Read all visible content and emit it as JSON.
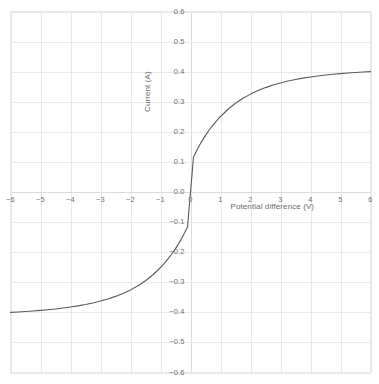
{
  "chart_data": {
    "type": "line",
    "title": "",
    "xlabel": "Potential difference (V)",
    "ylabel": "Current (A)",
    "xlim": [
      -6,
      6
    ],
    "ylim": [
      -0.6,
      0.6
    ],
    "grid": true,
    "legend": "none",
    "x_ticks": [
      "-6",
      "-5",
      "-4",
      "-3",
      "-2",
      "-1",
      "0",
      "1",
      "2",
      "3",
      "4",
      "5",
      "6"
    ],
    "x_tick_values": [
      -6,
      -5,
      -4,
      -3,
      -2,
      -1,
      0,
      1,
      2,
      3,
      4,
      5,
      6
    ],
    "y_ticks": [
      "0.6",
      "0.5",
      "0.4",
      "0.3",
      "0.2",
      "0.1",
      "0.0",
      "-0.1",
      "-0.2",
      "-0.3",
      "-0.4",
      "-0.5",
      "-0.6"
    ],
    "y_tick_values": [
      0.6,
      0.5,
      0.4,
      0.3,
      0.2,
      0.1,
      0.0,
      -0.1,
      -0.2,
      -0.3,
      -0.4,
      -0.5,
      -0.6
    ],
    "series": [
      {
        "name": "Current vs potential difference",
        "color": "#5a5a5a",
        "x": [
          -6.0,
          -5.75,
          -5.5,
          -5.25,
          -5.0,
          -4.75,
          -4.5,
          -4.25,
          -4.0,
          -3.75,
          -3.5,
          -3.25,
          -3.0,
          -2.75,
          -2.5,
          -2.25,
          -2.0,
          -1.75,
          -1.5,
          -1.25,
          -1.0,
          -0.875,
          -0.75,
          -0.625,
          -0.5,
          -0.4,
          -0.3,
          -0.2,
          -0.1,
          0.0,
          0.1,
          0.2,
          0.3,
          0.4,
          0.5,
          0.625,
          0.75,
          0.875,
          1.0,
          1.25,
          1.5,
          1.75,
          2.0,
          2.25,
          2.5,
          2.75,
          3.0,
          3.25,
          3.5,
          3.75,
          4.0,
          4.25,
          4.5,
          4.75,
          5.0,
          5.25,
          5.5,
          5.75,
          6.0
        ],
        "y": [
          -0.4,
          -0.3987,
          -0.3972,
          -0.3955,
          -0.3936,
          -0.3913,
          -0.3888,
          -0.3858,
          -0.3824,
          -0.3785,
          -0.374,
          -0.3687,
          -0.3626,
          -0.3554,
          -0.347,
          -0.3371,
          -0.3254,
          -0.3115,
          -0.2949,
          -0.275,
          -0.251,
          -0.2373,
          -0.2224,
          -0.2061,
          -0.1882,
          -0.1724,
          -0.1552,
          -0.1366,
          -0.1163,
          -0.0,
          0.1163,
          0.1366,
          0.1552,
          0.1724,
          0.1882,
          0.2061,
          0.2224,
          0.2373,
          0.251,
          0.275,
          0.2949,
          0.3115,
          0.3254,
          0.3371,
          0.347,
          0.3554,
          0.3626,
          0.3687,
          0.374,
          0.3785,
          0.3824,
          0.3858,
          0.3888,
          0.3913,
          0.3936,
          0.3955,
          0.3972,
          0.3987,
          0.4
        ]
      }
    ]
  },
  "colors": {
    "curve": "#5a5a5a",
    "grid": "#e9e9e9",
    "axis_line": "#dcdcdc",
    "tick_text": "#707070",
    "axis_title_text": "#6a6a6a",
    "background": "#ffffff"
  }
}
